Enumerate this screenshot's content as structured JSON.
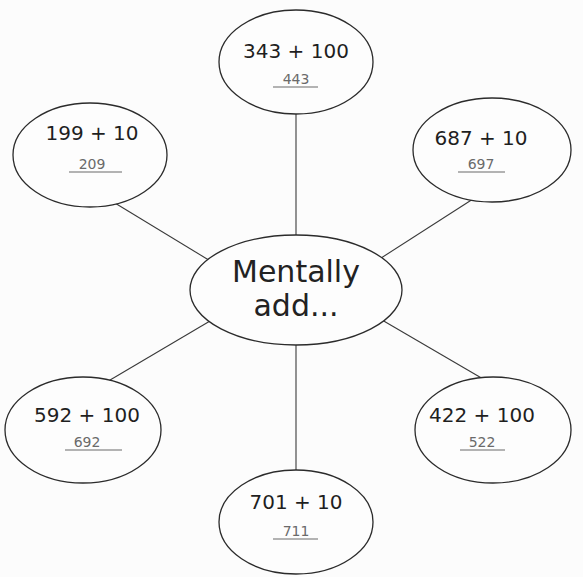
{
  "center": {
    "lines": [
      "Mentally",
      "add..."
    ]
  },
  "nodes": [
    {
      "id": "top",
      "expression": "343 + 100",
      "answer": "443"
    },
    {
      "id": "top-left",
      "expression": "199 + 10",
      "answer": "209"
    },
    {
      "id": "top-right",
      "expression": "687 + 10",
      "answer": "697"
    },
    {
      "id": "bottom-left",
      "expression": "592 + 100",
      "answer": "692"
    },
    {
      "id": "bottom-right",
      "expression": "422 + 100",
      "answer": "522"
    },
    {
      "id": "bottom",
      "expression": "701 + 10",
      "answer": "711"
    }
  ]
}
